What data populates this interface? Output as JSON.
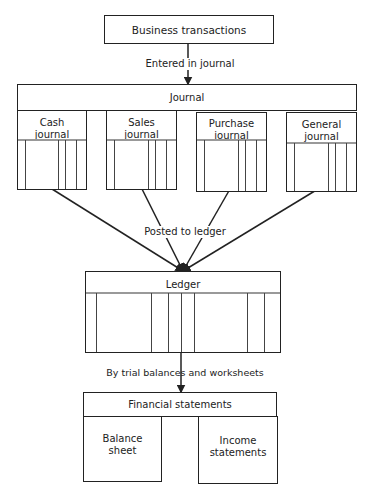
{
  "diagram": {
    "top_box": "Business transactions",
    "edge1_label": "Entered in journal",
    "journal": {
      "title": "Journal",
      "sub": [
        {
          "label": "Cash journal",
          "l1": "Cash",
          "l2": "journal"
        },
        {
          "label": "Sales journal",
          "l1": "Sales",
          "l2": "journal"
        },
        {
          "label": "Purchase journal",
          "l1": "Purchase",
          "l2": "journal"
        },
        {
          "label": "General journal",
          "l1": "General",
          "l2": "journal"
        }
      ]
    },
    "edge2_label": "Posted to ledger",
    "ledger": {
      "title": "Ledger"
    },
    "edge3_label": "By trial balances and worksheets",
    "financial": {
      "title": "Financial statements",
      "balance_l1": "Balance",
      "balance_l2": "sheet",
      "income_l1": "Income",
      "income_l2": "statements"
    }
  }
}
